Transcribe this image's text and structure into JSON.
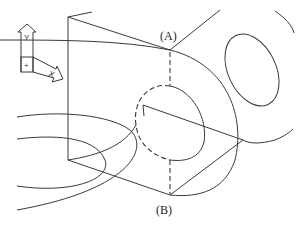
{
  "diagram": {
    "labels": {
      "point_a": "(A)",
      "point_b": "(B)"
    },
    "axis_icon": {
      "y_label": "Y",
      "x_label": "X",
      "origin_label": "+"
    },
    "stroke_color": "#3a3a3a"
  }
}
